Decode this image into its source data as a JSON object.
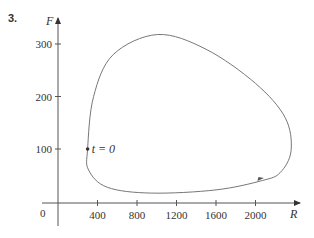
{
  "problem_number": "3.",
  "chart_data": {
    "type": "line",
    "title": "",
    "xlabel": "R",
    "ylabel": "F",
    "xlim": [
      0,
      2450
    ],
    "ylim": [
      -40,
      360
    ],
    "x_ticks": [
      0,
      400,
      800,
      1200,
      1600,
      2000
    ],
    "x_tick_labels": [
      "400",
      "800",
      "1200",
      "1600",
      "2000"
    ],
    "y_ticks": [
      100,
      200,
      300
    ],
    "y_tick_labels": [
      "100",
      "200",
      "300"
    ],
    "origin_label": "0",
    "grid": false,
    "legend": null,
    "series": [
      {
        "name": "phase trajectory",
        "closed": true,
        "direction": "counterclockwise",
        "points": [
          {
            "R": 300,
            "F": 100
          },
          {
            "R": 360,
            "F": 200
          },
          {
            "R": 560,
            "F": 280
          },
          {
            "R": 1010,
            "F": 318
          },
          {
            "R": 1500,
            "F": 290
          },
          {
            "R": 2000,
            "F": 225
          },
          {
            "R": 2300,
            "F": 160
          },
          {
            "R": 2360,
            "F": 97
          },
          {
            "R": 2250,
            "F": 55
          },
          {
            "R": 2070,
            "F": 40
          },
          {
            "R": 1600,
            "F": 22
          },
          {
            "R": 950,
            "F": 16
          },
          {
            "R": 500,
            "F": 27
          },
          {
            "R": 310,
            "F": 60
          },
          {
            "R": 300,
            "F": 100
          }
        ]
      }
    ],
    "annotations": [
      {
        "text": "t = 0",
        "R": 300,
        "F": 100,
        "marker": "dot"
      },
      {
        "type": "arrow",
        "R": 2070,
        "F": 40,
        "direction": "right-up"
      }
    ]
  }
}
